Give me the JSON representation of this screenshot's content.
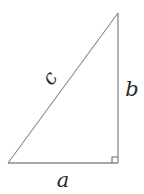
{
  "diagram": {
    "type": "right-triangle",
    "labels": {
      "hypotenuse": "c",
      "vertical_leg": "b",
      "horizontal_leg": "a"
    },
    "right_angle_marker": true,
    "colors": {
      "line": "#8a8a8a",
      "label": "#2a2a2a",
      "background": "#ffffff"
    },
    "vertices": {
      "bottom_left": [
        8,
        163
      ],
      "bottom_right": [
        118,
        163
      ],
      "top": [
        118,
        13
      ]
    }
  }
}
